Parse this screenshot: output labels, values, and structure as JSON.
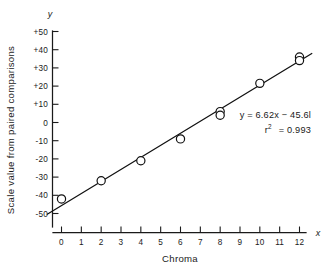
{
  "chart_data": {
    "type": "scatter",
    "title": "",
    "subtitle": "",
    "xlabel": "Chroma",
    "ylabel": "Scale value from paired comparisons",
    "x_axis_marker": "x",
    "y_axis_marker": "y",
    "xlim": [
      -0.75,
      12.75
    ],
    "ylim": [
      -57,
      52
    ],
    "grid": false,
    "legend": null,
    "x_ticks": [
      0,
      1,
      2,
      3,
      4,
      5,
      6,
      7,
      8,
      9,
      10,
      11,
      12
    ],
    "x_tick_labels": [
      "0",
      "1",
      "2",
      "3",
      "4",
      "5",
      "6",
      "7",
      "8",
      "9",
      "10",
      "11",
      "12"
    ],
    "y_ticks": [
      -50,
      -40,
      -30,
      -20,
      -10,
      0,
      10,
      20,
      30,
      40,
      50
    ],
    "y_tick_labels": [
      "-50",
      "-40",
      "-30",
      "-20",
      "-10",
      "0",
      "+10",
      "+20",
      "+30",
      "+40",
      "+50"
    ],
    "series": [
      {
        "name": "Paired comparison scale values",
        "marker": "open-circle",
        "x": [
          0,
          2,
          4,
          6,
          8,
          8,
          10,
          12,
          12
        ],
        "y": [
          -42,
          -32,
          -21,
          -9,
          6,
          4,
          21.5,
          36,
          34
        ]
      }
    ],
    "fit": {
      "type": "linear",
      "slope": 6.62,
      "intercept": -45.61,
      "r_squared": 0.993,
      "x_start": -0.72,
      "x_end": 12.62
    },
    "annotations": [
      {
        "name": "regression-equation",
        "text": "y = 6.62x − 45.6l"
      },
      {
        "name": "r-squared-base",
        "text": "r"
      },
      {
        "name": "r-squared-exponent",
        "text": "2"
      },
      {
        "name": "r-squared-value",
        "text": "= 0.993"
      }
    ]
  },
  "figure": {
    "caption": ""
  }
}
